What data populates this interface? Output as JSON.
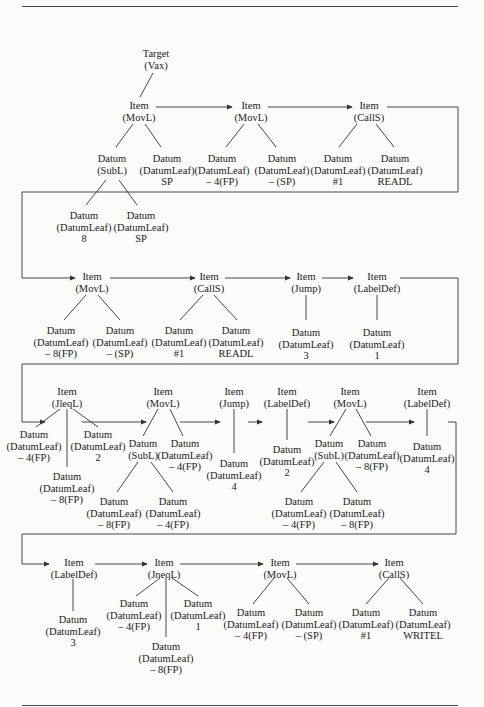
{
  "root": {
    "line1": "Target",
    "line2": "(Vax)"
  },
  "nodes": {
    "r1_i1": {
      "line1": "Item",
      "line2": "(MovL)"
    },
    "r1_i2": {
      "line1": "Item",
      "line2": "(MovL)"
    },
    "r1_i3": {
      "line1": "Item",
      "line2": "(CallS)"
    },
    "r1_d1": {
      "line1": "Datum",
      "line2": "(SubL)"
    },
    "r1_d2": {
      "line1": "Datum",
      "line2": "(DatumLeaf)",
      "line3": "SP"
    },
    "r1_d3": {
      "line1": "Datum",
      "line2": "(DatumLeaf)",
      "line3": "8"
    },
    "r1_d4": {
      "line1": "Datum",
      "line2": "(DatumLeaf)",
      "line3": "SP"
    },
    "r1_d5": {
      "line1": "Datum",
      "line2": "(DatumLeaf)",
      "line3": "– 4(FP)"
    },
    "r1_d6": {
      "line1": "Datum",
      "line2": "(DatumLeaf)",
      "line3": "– (SP)"
    },
    "r1_d7": {
      "line1": "Datum",
      "line2": "(DatumLeaf)",
      "line3": "#1"
    },
    "r1_d8": {
      "line1": "Datum",
      "line2": "(DatumLeaf)",
      "line3": "READL"
    },
    "r2_i1": {
      "line1": "Item",
      "line2": "(MovL)"
    },
    "r2_i2": {
      "line1": "Item",
      "line2": "(CallS)"
    },
    "r2_i3": {
      "line1": "Item",
      "line2": "(Jump)"
    },
    "r2_i4": {
      "line1": "Item",
      "line2": "(LabelDef)"
    },
    "r2_d1": {
      "line1": "Datum",
      "line2": "(DatumLeaf)",
      "line3": "– 8(FP)"
    },
    "r2_d2": {
      "line1": "Datum",
      "line2": "(DatumLeaf)",
      "line3": "– (SP)"
    },
    "r2_d3": {
      "line1": "Datum",
      "line2": "(DatumLeaf)",
      "line3": "#1"
    },
    "r2_d4": {
      "line1": "Datum",
      "line2": "(DatumLeaf)",
      "line3": "READL"
    },
    "r2_d5": {
      "line1": "Datum",
      "line2": "(DatumLeaf)",
      "line3": "3"
    },
    "r2_d6": {
      "line1": "Datum",
      "line2": "(DatumLeaf)",
      "line3": "1"
    },
    "r3_i1": {
      "line1": "Item",
      "line2": "(JleqL)"
    },
    "r3_i2": {
      "line1": "Item",
      "line2": "(MovL)"
    },
    "r3_i3": {
      "line1": "Item",
      "line2": "(Jump)"
    },
    "r3_i4": {
      "line1": "Item",
      "line2": "(LabelDef)"
    },
    "r3_i5": {
      "line1": "Item",
      "line2": "(MovL)"
    },
    "r3_i6": {
      "line1": "Item",
      "line2": "(LabelDef)"
    },
    "r3_d1": {
      "line1": "Datum",
      "line2": "(DatumLeaf)",
      "line3": "– 4(FP)"
    },
    "r3_d2": {
      "line1": "Datum",
      "line2": "(DatumLeaf)",
      "line3": "– 8(FP)"
    },
    "r3_d3": {
      "line1": "Datum",
      "line2": "(DatumLeaf)",
      "line3": "2"
    },
    "r3_d4": {
      "line1": "Datum",
      "line2": "(SubL)"
    },
    "r3_d5": {
      "line1": "Datum",
      "line2": "(DatumLeaf)",
      "line3": "– 4(FP)"
    },
    "r3_d6": {
      "line1": "Datum",
      "line2": "(DatumLeaf)",
      "line3": "– 8(FP)"
    },
    "r3_d7": {
      "line1": "Datum",
      "line2": "(DatumLeaf)",
      "line3": "– 4(FP)"
    },
    "r3_d8": {
      "line1": "Datum",
      "line2": "(DatumLeaf)",
      "line3": "4"
    },
    "r3_d9": {
      "line1": "Datum",
      "line2": "(DatumLeaf)",
      "line3": "2"
    },
    "r3_d10": {
      "line1": "Datum",
      "line2": "(SubL)"
    },
    "r3_d11": {
      "line1": "Datum",
      "line2": "(DatumLeaf)",
      "line3": "– 8(FP)"
    },
    "r3_d12": {
      "line1": "Datum",
      "line2": "(DatumLeaf)",
      "line3": "– 4(FP)"
    },
    "r3_d13": {
      "line1": "Datum",
      "line2": "(DatumLeaf)",
      "line3": "– 8(FP)"
    },
    "r3_d14": {
      "line1": "Datum",
      "line2": "(DatumLeaf)",
      "line3": "4"
    },
    "r4_i1": {
      "line1": "Item",
      "line2": "(LabelDef)"
    },
    "r4_i2": {
      "line1": "Item",
      "line2": "(JneqL)"
    },
    "r4_i3": {
      "line1": "Item",
      "line2": "(MovL)"
    },
    "r4_i4": {
      "line1": "Item",
      "line2": "(CallS)"
    },
    "r4_d1": {
      "line1": "Datum",
      "line2": "(DatumLeaf)",
      "line3": "3"
    },
    "r4_d2": {
      "line1": "Datum",
      "line2": "(DatumLeaf)",
      "line3": "– 4(FP)"
    },
    "r4_d3": {
      "line1": "Datum",
      "line2": "(DatumLeaf)",
      "line3": "– 8(FP)"
    },
    "r4_d4": {
      "line1": "Datum",
      "line2": "(DatumLeaf)",
      "line3": "1"
    },
    "r4_d5": {
      "line1": "Datum",
      "line2": "(DatumLeaf)",
      "line3": "– 4(FP)"
    },
    "r4_d6": {
      "line1": "Datum",
      "line2": "(DatumLeaf)",
      "line3": "– (SP)"
    },
    "r4_d7": {
      "line1": "Datum",
      "line2": "(DatumLeaf)",
      "line3": "#1"
    },
    "r4_d8": {
      "line1": "Datum",
      "line2": "(DatumLeaf)",
      "line3": "WRITEL"
    }
  }
}
